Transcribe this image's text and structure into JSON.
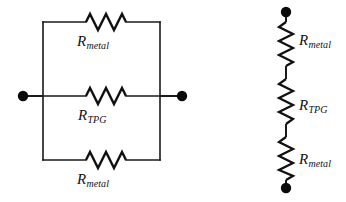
{
  "figure": {
    "type": "circuit-diagram",
    "background_color": "#ffffff",
    "line_color": "#1a1a1a",
    "node_color": "#0a0a0a"
  },
  "parallel_network": {
    "name": "parallel-resistor-network",
    "terminals": [
      {
        "name": "left-terminal",
        "cx": 23,
        "cy": 96,
        "r": 5.2
      },
      {
        "name": "right-terminal",
        "cx": 182,
        "cy": 96,
        "r": 5.2
      }
    ],
    "branches": [
      {
        "id": "top",
        "label_base": "R",
        "label_sub": "metal",
        "label_full": "R_metal",
        "y": 22
      },
      {
        "id": "middle",
        "label_base": "R",
        "label_sub": "TPG",
        "label_full": "R_TPG",
        "y": 96
      },
      {
        "id": "bottom",
        "label_base": "R",
        "label_sub": "metal",
        "label_full": "R_metal",
        "y": 160
      }
    ],
    "rail_x_left": 43,
    "rail_x_right": 160
  },
  "series_network": {
    "name": "series-resistor-chain",
    "terminals": [
      {
        "name": "top-terminal",
        "cx": 286,
        "cy": 12,
        "r": 5.2
      },
      {
        "name": "bottom-terminal",
        "cx": 286,
        "cy": 188,
        "r": 5.2
      }
    ],
    "resistors": [
      {
        "id": "r1",
        "label_base": "R",
        "label_sub": "metal",
        "label_full": "R_metal"
      },
      {
        "id": "r2",
        "label_base": "R",
        "label_sub": "TPG",
        "label_full": "R_TPG"
      },
      {
        "id": "r3",
        "label_base": "R",
        "label_sub": "metal",
        "label_full": "R_metal"
      }
    ],
    "axis_x": 286
  }
}
